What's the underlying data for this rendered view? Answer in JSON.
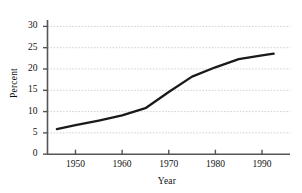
{
  "chart_data": {
    "type": "line",
    "title": "",
    "subtitle": "",
    "xlabel": "Year",
    "ylabel": "Percent",
    "xlim": [
      1944,
      1996
    ],
    "ylim": [
      0,
      31.5
    ],
    "xticks": [
      1950,
      1960,
      1970,
      1980,
      1990
    ],
    "xtick_labels": [
      "1950",
      "1960",
      "1970",
      "1980",
      "1990"
    ],
    "yticks": [
      0,
      5,
      10,
      15,
      20,
      25,
      30
    ],
    "ytick_labels": [
      "0",
      "5",
      "10",
      "15",
      "20",
      "25",
      "30"
    ],
    "grid": "horizontal",
    "legend": "none",
    "annotations": [],
    "series": [
      {
        "name": "Percent",
        "color": "#1a1a1a",
        "x": [
          1946,
          1950,
          1955,
          1960,
          1965,
          1970,
          1975,
          1980,
          1985,
          1990,
          1992.5
        ],
        "values": [
          5.9,
          6.8,
          7.9,
          9.1,
          10.8,
          14.6,
          18.2,
          20.4,
          22.3,
          23.2,
          23.6
        ]
      }
    ]
  },
  "axes": {
    "ylabel_text": "Percent",
    "xlabel_text": "Year"
  },
  "colors": {
    "line": "#1a1a1a",
    "grid": "#c9c9c9",
    "spine": "#555555",
    "text": "#111111",
    "background": "#ffffff"
  }
}
